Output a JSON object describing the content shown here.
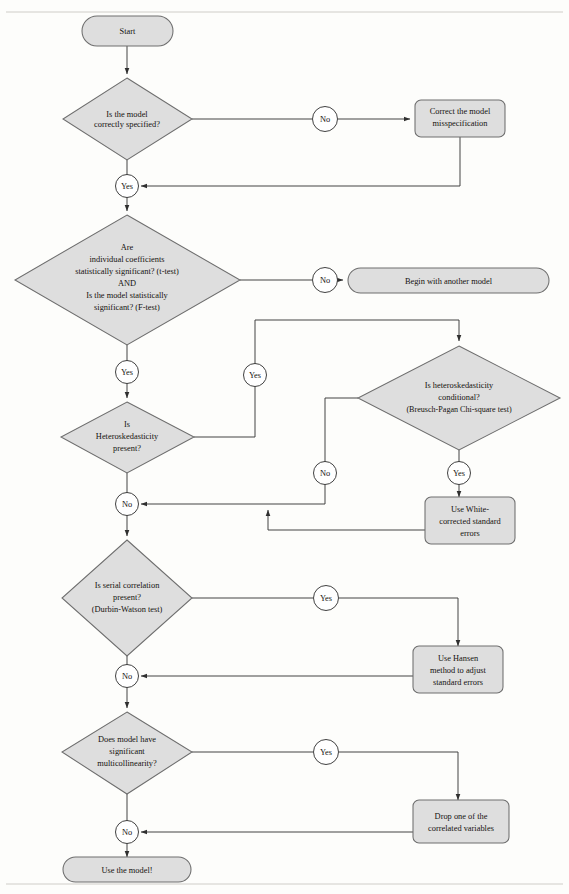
{
  "page": {
    "top_rule": true,
    "bottom_rule": true,
    "colors": {
      "shape_fill": "#dedede",
      "shape_stroke": "#6e6e6e",
      "circle_fill": "#ffffff",
      "line": "#3a3a3a",
      "text": "#15120f",
      "background": "#fdfdfb"
    }
  },
  "nodes": {
    "start": {
      "type": "terminator",
      "label": "Start"
    },
    "d_spec": {
      "type": "decision",
      "lines": [
        "Is the model",
        "correctly specified?"
      ]
    },
    "b_correct": {
      "type": "process",
      "lines": [
        "Correct the model",
        "misspecification"
      ]
    },
    "d_signif": {
      "type": "decision",
      "lines": [
        "Are",
        "individual coefficients",
        "statistically significant? (t-test)",
        "AND",
        "Is the model statistically",
        "significant? (F-test)"
      ]
    },
    "b_begin": {
      "type": "terminator",
      "label": "Begin with another model"
    },
    "d_hetero": {
      "type": "decision",
      "lines": [
        "Is",
        "Heteroskedasticity",
        "present?"
      ]
    },
    "d_cond": {
      "type": "decision",
      "lines": [
        "Is heteroskedasticity",
        "conditional?",
        "(Breusch-Pagan Chi-square test)"
      ]
    },
    "b_white": {
      "type": "process",
      "lines": [
        "Use White-",
        "corrected standard",
        "errors"
      ]
    },
    "d_serial": {
      "type": "decision",
      "lines": [
        "Is serial correlation",
        "present?",
        "(Durbin-Watson test)"
      ]
    },
    "b_hansen": {
      "type": "process",
      "lines": [
        "Use Hansen",
        "method to adjust",
        "standard errors"
      ]
    },
    "d_multi": {
      "type": "decision",
      "lines": [
        "Does model have",
        "significant",
        "multicollinearity?"
      ]
    },
    "b_drop": {
      "type": "process",
      "lines": [
        "Drop one of the",
        "correlated variables"
      ]
    },
    "end": {
      "type": "terminator",
      "label": "Use the model!"
    }
  },
  "edge_labels": {
    "spec_no": "No",
    "spec_yes": "Yes",
    "signif_no": "No",
    "signif_yes": "Yes",
    "hetero_yes": "Yes",
    "hetero_no": "No",
    "cond_no": "No",
    "cond_yes": "Yes",
    "serial_yes": "Yes",
    "serial_no": "No",
    "multi_yes": "Yes",
    "multi_no": "No"
  }
}
